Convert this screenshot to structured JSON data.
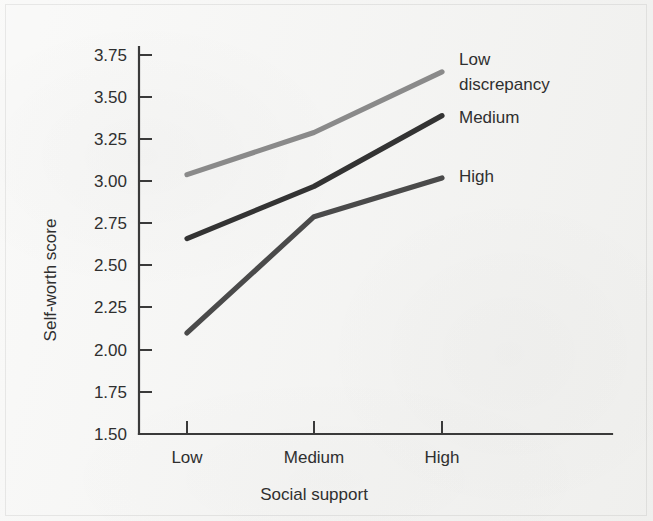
{
  "figure": {
    "background_color": "#f3f3f1",
    "ink_color": "#2f2f2f"
  },
  "chart_data": {
    "type": "line",
    "title": "",
    "xlabel": "Social support",
    "ylabel": "Self-worth score",
    "categories": [
      "Low",
      "Medium",
      "High"
    ],
    "x": [
      1,
      2,
      3
    ],
    "ylim": [
      1.5,
      3.75
    ],
    "ytick_labels": [
      "1.50",
      "1.75",
      "2.00",
      "2.25",
      "2.50",
      "2.75",
      "3.00",
      "3.25",
      "3.50",
      "3.75"
    ],
    "ytick_values": [
      1.5,
      1.75,
      2.0,
      2.25,
      2.5,
      2.75,
      3.0,
      3.25,
      3.5,
      3.75
    ],
    "grid": false,
    "legend_position": "inline-right-of-line-ends",
    "series": [
      {
        "name": "Low discrepancy",
        "label_line_1": "Low",
        "label_line_2": "discrepancy",
        "color": "#8a8a8a",
        "values": [
          3.04,
          3.29,
          3.65
        ]
      },
      {
        "name": "Medium",
        "label_line_1": "Medium",
        "label_line_2": "",
        "color": "#333333",
        "values": [
          2.66,
          2.97,
          3.39
        ]
      },
      {
        "name": "High",
        "label_line_1": "High",
        "label_line_2": "",
        "color": "#4a4a4a",
        "values": [
          2.1,
          2.79,
          3.02
        ]
      }
    ]
  }
}
